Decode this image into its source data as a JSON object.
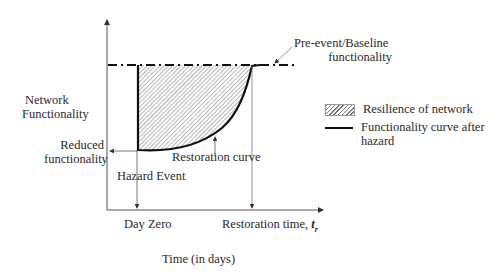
{
  "diagram": {
    "y_axis_label_line1": "Network",
    "y_axis_label_line2": "Functionality",
    "x_axis_label": "Time (in days)",
    "baseline_label_line1": "Pre-event/Baseline",
    "baseline_label_line2": "functionality",
    "reduced_label_line1": "Reduced",
    "reduced_label_line2": "functionality",
    "hazard_event_label": "Hazard Event",
    "restoration_curve_label": "Restoration curve",
    "day_zero_label": "Day Zero",
    "restoration_time_label": "Restoration time, ",
    "restoration_time_symbol": "t",
    "restoration_time_subscript": "r"
  },
  "legend": {
    "items": [
      {
        "label": "Resilience of network",
        "swatch": "hatched"
      },
      {
        "label_line1": "Functionality curve after",
        "label_line2": "hazard",
        "swatch": "line"
      }
    ]
  },
  "colors": {
    "axis": "#555555",
    "curve": "#111111",
    "hatch": "#777777",
    "background": "#ffffff"
  }
}
